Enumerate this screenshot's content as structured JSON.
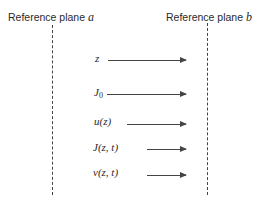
{
  "diagram": {
    "planes": [
      {
        "label": "Reference plane",
        "symbol": "a"
      },
      {
        "label": "Reference plane",
        "symbol": "b"
      }
    ],
    "variables": [
      {
        "name": "z"
      },
      {
        "name": "J",
        "sub": "0"
      },
      {
        "name": "u(z)"
      },
      {
        "name": "J(z, t)"
      },
      {
        "name": "v(z, t)"
      }
    ]
  }
}
